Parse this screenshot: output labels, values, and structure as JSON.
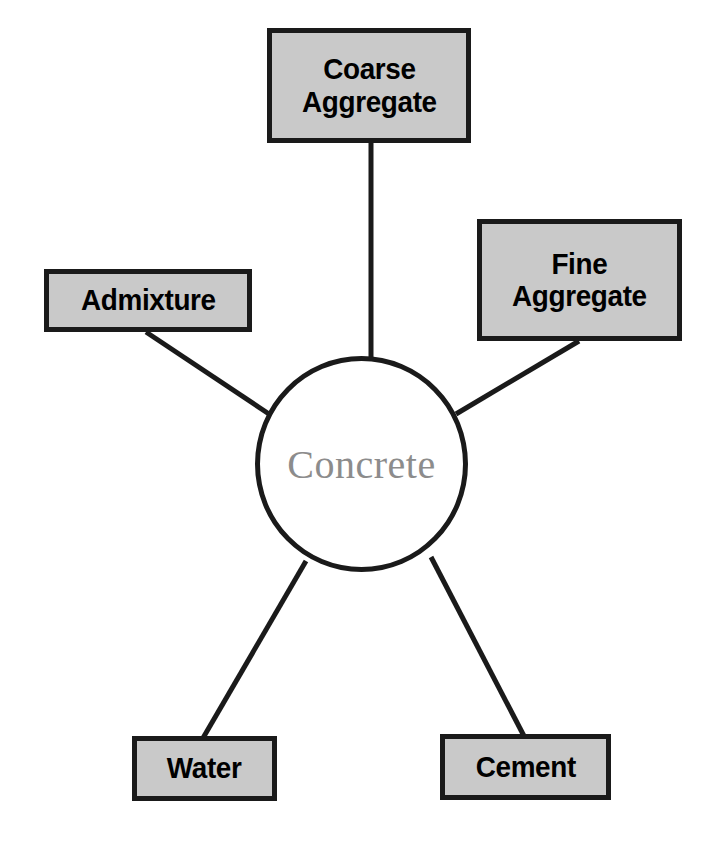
{
  "diagram": {
    "type": "hub-and-spoke",
    "center": {
      "label": "Concrete",
      "shape": "circle",
      "text_color": "#8c8c8c",
      "fill_color": "#ffffff",
      "border_color": "#1a1a1a"
    },
    "style": {
      "node_fill": "#c9c9c9",
      "node_border": "#1a1a1a",
      "node_text": "#000000",
      "connector_color": "#1a1a1a",
      "background": "#ffffff"
    },
    "nodes": [
      {
        "id": "coarse-aggregate",
        "label": "Coarse\nAggregate",
        "line1": "Coarse",
        "line2": "Aggregate",
        "position": "top"
      },
      {
        "id": "fine-aggregate",
        "label": "Fine\nAggregate",
        "line1": "Fine",
        "line2": "Aggregate",
        "position": "upper-right"
      },
      {
        "id": "admixture",
        "label": "Admixture",
        "line1": "Admixture",
        "line2": "",
        "position": "upper-left"
      },
      {
        "id": "water",
        "label": "Water",
        "line1": "Water",
        "line2": "",
        "position": "bottom-left"
      },
      {
        "id": "cement",
        "label": "Cement",
        "line1": "Cement",
        "line2": "",
        "position": "bottom-right"
      }
    ],
    "connectors": [
      {
        "from": "coarse-aggregate",
        "to": "concrete"
      },
      {
        "from": "fine-aggregate",
        "to": "concrete"
      },
      {
        "from": "admixture",
        "to": "concrete"
      },
      {
        "from": "water",
        "to": "concrete"
      },
      {
        "from": "cement",
        "to": "concrete"
      }
    ]
  }
}
